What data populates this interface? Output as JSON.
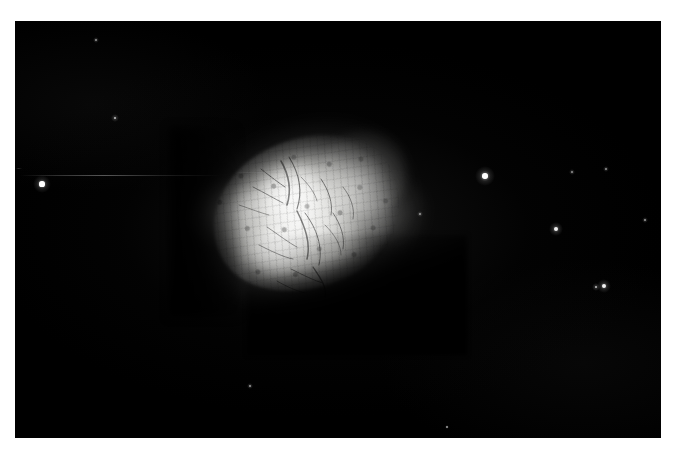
{
  "image": {
    "kind": "astronomical-photographic-plate",
    "subject": "bright irregular mottled nebula",
    "orientation": "landscape",
    "width_px": 677,
    "height_px": 456,
    "border_color": "#ffffff",
    "sky_color": "#000000",
    "nebula_peak_color": "#f8f8f6",
    "caption": ""
  },
  "frame": {
    "border_left_px": 15,
    "border_top_px": 21,
    "border_right_px": 16,
    "border_bottom_px": 18,
    "plate_left": 15,
    "plate_top": 21,
    "plate_width": 646,
    "plate_height": 417
  },
  "nebula": {
    "label": "nebula",
    "center_x": 313,
    "center_y": 215,
    "bounds": {
      "x": 193,
      "y": 117,
      "w": 240,
      "h": 200
    },
    "position_angle_deg": -26,
    "long_axis_px": 215,
    "short_axis_px": 150,
    "edge_west": "soft wispy filamentary",
    "edge_southeast": "sharp dark cut",
    "bright_knots": [
      {
        "name": "northwest-knot",
        "x": 289,
        "y": 182
      },
      {
        "name": "southwest-knot",
        "x": 281,
        "y": 236
      }
    ]
  },
  "stars": [
    {
      "name": "star-field-west-bright",
      "x": 42,
      "y": 184,
      "r": 2.6,
      "glow": 9,
      "brightness": "bright"
    },
    {
      "name": "star-field-northeast-bright",
      "x": 485,
      "y": 176,
      "r": 2.7,
      "glow": 10,
      "brightness": "bright"
    },
    {
      "name": "star-field-east-mid",
      "x": 556,
      "y": 229,
      "r": 2.0,
      "glow": 7,
      "brightness": "medium"
    },
    {
      "name": "star-field-southeast-a",
      "x": 604,
      "y": 286,
      "r": 2.0,
      "glow": 7,
      "brightness": "medium"
    },
    {
      "name": "star-field-southeast-b",
      "x": 596,
      "y": 287,
      "r": 1.1,
      "glow": 4,
      "brightness": "faint"
    },
    {
      "name": "star-field-northwest-faint",
      "x": 115,
      "y": 118,
      "r": 1.3,
      "glow": 4,
      "brightness": "faint"
    },
    {
      "name": "star-field-upper-left-vfaint",
      "x": 96,
      "y": 40,
      "r": 0.9,
      "glow": 3,
      "brightness": "very-faint"
    },
    {
      "name": "star-field-upper-right-vfaint",
      "x": 572,
      "y": 172,
      "r": 1.0,
      "glow": 3,
      "brightness": "very-faint"
    },
    {
      "name": "star-field-right-vfaint",
      "x": 606,
      "y": 169,
      "r": 0.9,
      "glow": 3,
      "brightness": "very-faint"
    },
    {
      "name": "star-field-right-edge-vfaint",
      "x": 645,
      "y": 220,
      "r": 0.8,
      "glow": 3,
      "brightness": "very-faint"
    },
    {
      "name": "star-field-lower-mid-vfaint",
      "x": 250,
      "y": 386,
      "r": 0.8,
      "glow": 3,
      "brightness": "very-faint"
    },
    {
      "name": "star-field-lower-right-vfaint",
      "x": 447,
      "y": 427,
      "r": 0.7,
      "glow": 2,
      "brightness": "very-faint"
    },
    {
      "name": "star-field-nebula-edge-vfaint",
      "x": 420,
      "y": 214,
      "r": 0.9,
      "glow": 3,
      "brightness": "very-faint"
    }
  ],
  "artifacts": [
    {
      "name": "emulsion-scratch-horizontal",
      "x": 20,
      "y": 175,
      "w": 200,
      "h": 1
    },
    {
      "name": "emulsion-scratch-short",
      "x": 235,
      "y": 172,
      "w": 60,
      "h": 1
    },
    {
      "name": "plate-edge-nick",
      "x": 16,
      "y": 168,
      "w": 6,
      "h": 1
    }
  ]
}
